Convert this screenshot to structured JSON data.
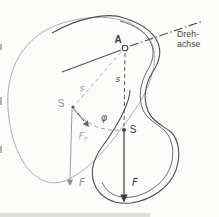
{
  "diagram": {
    "title_hint": "physical pendulum with rotation axis",
    "axis_label": {
      "line1": "Dreh-",
      "line2": "achse"
    },
    "pivot_label": "A",
    "angle_label": "φ",
    "displaced": {
      "com_label": "S",
      "arm_label": "s",
      "weight_label": "F",
      "restoring_label": "F",
      "restoring_sub": "r"
    },
    "rest": {
      "com_label": "S",
      "arm_label": "s",
      "weight_label": "F"
    },
    "colors": {
      "line_dark": "#4f4f4f",
      "line_gray": "#ababab",
      "dash_mid": "#8f8f8f",
      "text_dark": "#3a3a3a",
      "text_gray": "#9c9c9c",
      "background": "#fcfcfa"
    }
  }
}
